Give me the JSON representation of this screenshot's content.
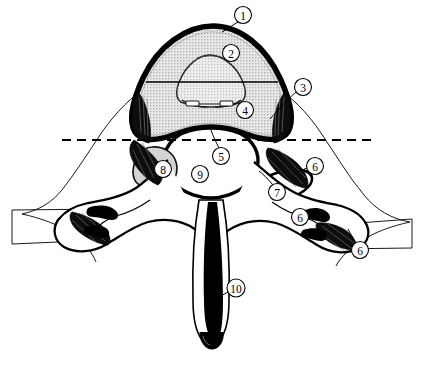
{
  "figure": {
    "type": "anatomical-diagram",
    "width": 422,
    "height": 368,
    "background_color": "#ffffff",
    "ink_color": "#000000",
    "body_fill_color": "#d9d9d9",
    "shade_fill_color": "#c9c9c9",
    "white_fill_color": "#ffffff"
  },
  "callouts": [
    {
      "id": "callout-1",
      "label": "1",
      "cx": 243,
      "cy": 15,
      "r": 8.5,
      "leader": [
        [
          238,
          22
        ],
        [
          222,
          32
        ]
      ]
    },
    {
      "id": "callout-2",
      "label": "2",
      "cx": 231,
      "cy": 53,
      "r": 8.5,
      "leader": []
    },
    {
      "id": "callout-3",
      "label": "3",
      "cx": 303,
      "cy": 87,
      "r": 8.5,
      "leader": [
        [
          296,
          92
        ],
        [
          282,
          104
        ],
        [
          270,
          118
        ]
      ]
    },
    {
      "id": "callout-4",
      "label": "4",
      "cx": 245,
      "cy": 110,
      "r": 8.5,
      "leader": []
    },
    {
      "id": "callout-5",
      "label": "5",
      "cx": 221,
      "cy": 156,
      "r": 8.5,
      "leader": [
        [
          219,
          148
        ],
        [
          215,
          139
        ],
        [
          212,
          132
        ]
      ]
    },
    {
      "id": "callout-6a",
      "label": "6",
      "cx": 315,
      "cy": 166,
      "r": 8.5,
      "leader": [
        [
          307,
          168
        ],
        [
          296,
          173
        ]
      ]
    },
    {
      "id": "callout-7",
      "label": "7",
      "cx": 277,
      "cy": 192,
      "r": 8.5,
      "leader": [
        [
          273,
          185
        ],
        [
          266,
          177
        ],
        [
          259,
          172
        ]
      ]
    },
    {
      "id": "callout-8",
      "label": "8",
      "cx": 163,
      "cy": 169,
      "r": 8.5,
      "leader": []
    },
    {
      "id": "callout-9",
      "label": "9",
      "cx": 200,
      "cy": 174,
      "r": 8.5,
      "leader": []
    },
    {
      "id": "callout-6b",
      "label": "6",
      "cx": 300,
      "cy": 217,
      "r": 8.5,
      "leader": [
        [
          308,
          216
        ],
        [
          320,
          213
        ]
      ]
    },
    {
      "id": "callout-6c",
      "label": "6",
      "cx": 360,
      "cy": 250,
      "r": 8.5,
      "leader": [
        [
          356,
          243
        ],
        [
          350,
          234
        ]
      ]
    },
    {
      "id": "callout-10",
      "label": "10",
      "cx": 236,
      "cy": 288,
      "r": 9.0,
      "leader": [
        [
          228,
          292
        ],
        [
          216,
          299
        ],
        [
          208,
          303
        ]
      ]
    }
  ],
  "reference_lines": [
    {
      "id": "solid-section-line",
      "style": "solid",
      "x1": 146,
      "y1": 82,
      "x2": 278,
      "y2": 82,
      "width": 1.6
    },
    {
      "id": "dashed-section-line",
      "style": "dashed",
      "x1": 62,
      "y1": 140,
      "x2": 373,
      "y2": 140,
      "width": 1.8,
      "dash": "9 6"
    }
  ]
}
